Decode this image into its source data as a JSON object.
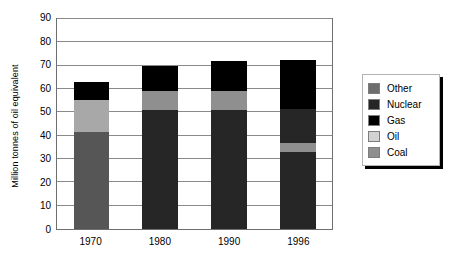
{
  "chart_data": {
    "type": "bar",
    "stacked": true,
    "title": "",
    "subtitle": "",
    "xlabel": "",
    "ylabel": "Million tonnes of oil equivalent",
    "categories": [
      "1970",
      "1980",
      "1990",
      "1996"
    ],
    "ylim": [
      0,
      90
    ],
    "ytick_step": 10,
    "ytick_labels": [
      "90",
      "80",
      "70",
      "60",
      "50",
      "40",
      "30",
      "20",
      "10",
      "0"
    ],
    "grid": true,
    "grid_axis": "y",
    "legend_position": "right",
    "legend_order": [
      "Other",
      "Nuclear",
      "Gas",
      "Oil",
      "Coal"
    ],
    "series": [
      {
        "name": "Coal",
        "color": "#565656",
        "values": [
          41.5,
          0,
          0,
          0
        ]
      },
      {
        "name": "Oil",
        "color": "#bdbdbd",
        "values": [
          14.0,
          8.0,
          8.0,
          4.0
        ]
      },
      {
        "name": "Gas",
        "color": "#000000",
        "values": [
          7.5,
          11.0,
          13.0,
          21.0
        ]
      },
      {
        "name": "Nuclear",
        "color": "#262626",
        "values": [
          0,
          51.0,
          51.0,
          47.5
        ]
      },
      {
        "name": "Other",
        "color": "#6e6e6e",
        "values": [
          0,
          0,
          0,
          0
        ]
      }
    ],
    "stack_order_bottom_to_top": [
      "Coal",
      "Nuclear",
      "Oil",
      "Gas"
    ],
    "bar_totals": [
      63.0,
      70.0,
      72.0,
      72.5
    ],
    "stacks": [
      {
        "category": "1970",
        "segments": [
          {
            "name": "Coal",
            "value": 41.5,
            "from": 0,
            "to": 41.5,
            "color": "#565656"
          },
          {
            "name": "Oil",
            "value": 14.0,
            "from": 41.5,
            "to": 55.5,
            "color": "#a8a8a8"
          },
          {
            "name": "Gas",
            "value": 7.5,
            "from": 55.5,
            "to": 63.0,
            "color": "#000000"
          }
        ]
      },
      {
        "category": "1980",
        "segments": [
          {
            "name": "Nuclear",
            "value": 51.0,
            "from": 0,
            "to": 51.0,
            "color": "#262626"
          },
          {
            "name": "Oil",
            "value": 8.0,
            "from": 51.0,
            "to": 59.0,
            "color": "#8f8f8f"
          },
          {
            "name": "Gas",
            "value": 11.0,
            "from": 59.0,
            "to": 70.0,
            "color": "#000000"
          }
        ]
      },
      {
        "category": "1990",
        "segments": [
          {
            "name": "Nuclear",
            "value": 51.0,
            "from": 0,
            "to": 51.0,
            "color": "#262626"
          },
          {
            "name": "Oil",
            "value": 8.0,
            "from": 51.0,
            "to": 59.0,
            "color": "#8f8f8f"
          },
          {
            "name": "Gas",
            "value": 13.0,
            "from": 59.0,
            "to": 72.0,
            "color": "#000000"
          }
        ]
      },
      {
        "category": "1996",
        "segments": [
          {
            "name": "Nuclear",
            "value": 33.0,
            "from": 0,
            "to": 33.0,
            "color": "#262626"
          },
          {
            "name": "Oil",
            "value": 4.0,
            "from": 33.0,
            "to": 37.0,
            "color": "#8f8f8f"
          },
          {
            "name": "Nuclear",
            "value": 14.5,
            "from": 37.0,
            "to": 51.5,
            "color": "#262626"
          },
          {
            "name": "Gas",
            "value": 21.0,
            "from": 51.5,
            "to": 72.5,
            "color": "#000000"
          }
        ]
      }
    ],
    "legend": [
      {
        "label": "Other",
        "color": "#6e6e6e"
      },
      {
        "label": "Nuclear",
        "color": "#262626"
      },
      {
        "label": "Gas",
        "color": "#000000"
      },
      {
        "label": "Oil",
        "color": "#d2d2d2"
      },
      {
        "label": "Coal",
        "color": "#8f8f8f"
      }
    ]
  }
}
